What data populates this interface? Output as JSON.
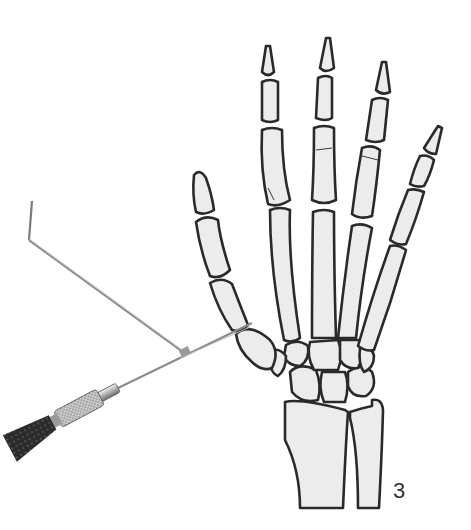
{
  "figure": {
    "label": "3",
    "colors": {
      "background": "#ffffff",
      "bone_fill": "#ececec",
      "bone_outline": "#2a2a2a",
      "metal": "#b8b8b8",
      "grip": "#2b2b2b"
    },
    "parts": {
      "guide": "wire guide rod",
      "kwire": "Kirschner wire",
      "drill": "hand drill chuck",
      "grip": "drill handle grip"
    }
  }
}
